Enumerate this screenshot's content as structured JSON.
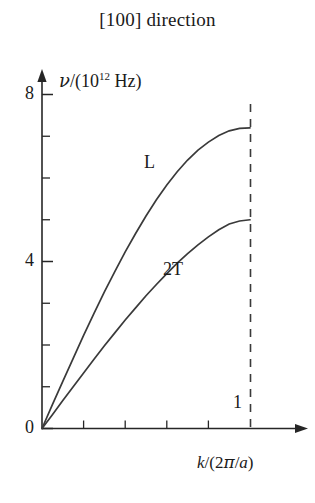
{
  "figure": {
    "title": "[100] direction",
    "background": "#ffffff",
    "ink_color": "#262626"
  },
  "axes": {
    "y_label_parts": {
      "symbol": "ν",
      "slash": "/(10",
      "exponent": "12",
      "unit": " Hz)"
    },
    "y_label_full": "ν/(10¹² Hz)",
    "x_label_full": "k/(2π/a)",
    "x_label_parts": {
      "k": "k",
      "open": "/(2",
      "pi": "π",
      "div": "/",
      "a": "a",
      "close": ")"
    },
    "y_major_ticks": [
      "0",
      "4",
      "8"
    ],
    "y_major_values": [
      0,
      4,
      8
    ],
    "y_minor_values": [
      1,
      2,
      3,
      5,
      6,
      7
    ],
    "x_minor_values": [
      0.2,
      0.4,
      0.6,
      0.8
    ],
    "zone_boundary_label": "1",
    "zone_boundary_value": 1
  },
  "curves": {
    "longitudinal_label": "L",
    "transverse_label": "2T"
  },
  "chart_data": {
    "type": "line",
    "title": "[100] direction",
    "xlabel": "k/(2π/a)",
    "ylabel": "ν/(10¹² Hz)",
    "xlim": [
      0,
      1.13
    ],
    "ylim": [
      0,
      8.55
    ],
    "grid": false,
    "legend": "inline-annotations",
    "x_major_ticks": [],
    "x_minor_ticks": [
      0.2,
      0.4,
      0.6,
      0.8
    ],
    "x_annotated_ticks": [
      1
    ],
    "y_major_ticks": [
      0,
      4,
      8
    ],
    "y_minor_ticks": [
      1,
      2,
      3,
      5,
      6,
      7
    ],
    "annotations": [
      {
        "text": "L",
        "x": 0.55,
        "y": 6.35
      },
      {
        "text": "2T",
        "x": 0.72,
        "y": 3.8
      },
      {
        "text": "1",
        "x": 0.97,
        "y": 0.55
      },
      {
        "text": "zone-boundary dashed line",
        "x": 1.0,
        "y": null
      }
    ],
    "x": [
      0,
      0.05,
      0.1,
      0.15,
      0.2,
      0.25,
      0.3,
      0.35,
      0.4,
      0.45,
      0.5,
      0.55,
      0.6,
      0.65,
      0.7,
      0.75,
      0.8,
      0.85,
      0.9,
      0.95,
      1.0
    ],
    "series": [
      {
        "name": "L",
        "description": "longitudinal acoustic branch",
        "max_value": 7.2,
        "values": [
          0,
          0.57,
          1.13,
          1.68,
          2.23,
          2.76,
          3.27,
          3.76,
          4.23,
          4.67,
          5.09,
          5.48,
          5.83,
          6.15,
          6.43,
          6.67,
          6.86,
          7.02,
          7.13,
          7.19,
          7.2
        ]
      },
      {
        "name": "2T",
        "description": "doubly degenerate transverse acoustic branch",
        "max_value": 5.0,
        "values": [
          0,
          0.33,
          0.67,
          1.0,
          1.33,
          1.66,
          1.98,
          2.29,
          2.6,
          2.89,
          3.18,
          3.45,
          3.71,
          3.96,
          4.19,
          4.4,
          4.59,
          4.76,
          4.9,
          4.97,
          5.0
        ]
      }
    ]
  },
  "geometry": {
    "origin_px": [
      42,
      428.5
    ],
    "px_per_y_unit": 41.75,
    "px_per_x_unit": 208,
    "y_axis_arrow_tip_px": 70,
    "x_axis_arrow_tip_px": 307,
    "zone_boundary_px": 250.5,
    "zone_boundary_dash_top_px": 104
  }
}
